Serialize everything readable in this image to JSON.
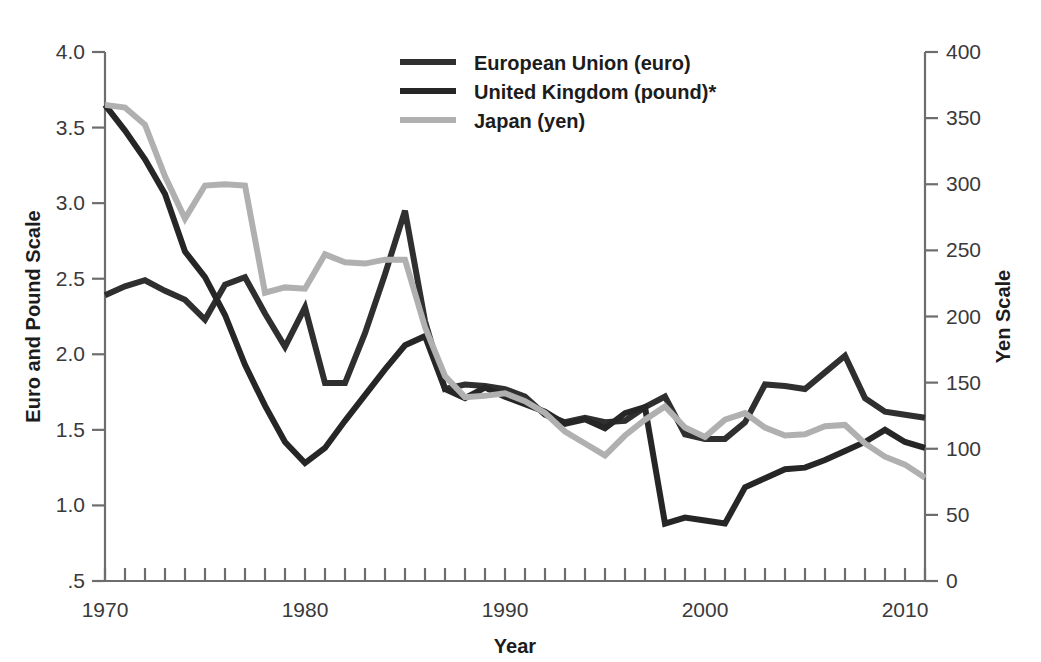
{
  "chart_data": {
    "type": "line",
    "title": "",
    "xlabel": "Year",
    "ylabel": "Euro and Pound Scale",
    "ylabel_right": "Yen Scale",
    "xlim": [
      1970,
      2011
    ],
    "ylim": [
      0.5,
      4.0
    ],
    "ylim_right": [
      0,
      400
    ],
    "grid": false,
    "legend_position": "top-center",
    "x_tick_labels": [
      "1970",
      "1980",
      "1990",
      "2000",
      "2010"
    ],
    "x_tick_values": [
      1970,
      1980,
      1990,
      2000,
      2010
    ],
    "x_minor_ticks_every": 1,
    "y_tick_labels": [
      ".5",
      "1.0",
      "1.5",
      "2.0",
      "2.5",
      "3.0",
      "3.5",
      "4.0"
    ],
    "y_tick_values": [
      0.5,
      1.0,
      1.5,
      2.0,
      2.5,
      3.0,
      3.5,
      4.0
    ],
    "y_right_tick_labels": [
      "0",
      "50",
      "100",
      "150",
      "200",
      "250",
      "300",
      "350",
      "400"
    ],
    "y_right_tick_values": [
      0,
      50,
      100,
      150,
      200,
      250,
      300,
      350,
      400
    ],
    "footnote_marker": "*",
    "x": [
      1970,
      1971,
      1972,
      1973,
      1974,
      1975,
      1976,
      1977,
      1978,
      1979,
      1980,
      1981,
      1982,
      1983,
      1984,
      1985,
      1986,
      1987,
      1988,
      1989,
      1990,
      1991,
      1992,
      1993,
      1994,
      1995,
      1996,
      1997,
      1998,
      1999,
      2000,
      2001,
      2002,
      2003,
      2004,
      2005,
      2006,
      2007,
      2008,
      2009,
      2010,
      2011
    ],
    "series": [
      {
        "name": "European Union (euro)",
        "axis": "left",
        "color": "#2f2f2f",
        "width": 6,
        "values": [
          2.39,
          2.45,
          2.49,
          2.42,
          2.36,
          2.23,
          2.46,
          2.51,
          2.27,
          2.05,
          2.31,
          1.81,
          1.81,
          2.14,
          2.53,
          2.95,
          2.22,
          1.77,
          1.8,
          1.79,
          1.77,
          1.72,
          1.6,
          1.55,
          1.58,
          1.55,
          1.56,
          1.65,
          1.72,
          1.47,
          1.44,
          1.44,
          1.55,
          1.8,
          1.79,
          1.77,
          1.88,
          1.99,
          1.71,
          1.62,
          1.6,
          1.58
        ]
      },
      {
        "name": "United Kingdom (pound)*",
        "axis": "left",
        "color": "#262626",
        "width": 6,
        "values": [
          3.65,
          3.48,
          3.29,
          3.06,
          2.68,
          2.51,
          2.26,
          1.93,
          1.66,
          1.42,
          1.28,
          1.38,
          1.56,
          1.73,
          1.9,
          2.06,
          2.12,
          1.77,
          1.71,
          1.78,
          1.72,
          1.67,
          1.62,
          1.54,
          1.57,
          1.51,
          1.61,
          1.65,
          0.88,
          0.92,
          0.9,
          0.88,
          1.12,
          1.18,
          1.24,
          1.25,
          1.3,
          1.36,
          1.42,
          1.5,
          1.42,
          1.38
        ]
      },
      {
        "name": "Japan (yen)",
        "axis": "right",
        "color": "#b0b0b0",
        "width": 6,
        "values": [
          360,
          358,
          345,
          306,
          274,
          299,
          300,
          299,
          218,
          222,
          221,
          247,
          241,
          240,
          243,
          243,
          192,
          155,
          139,
          140,
          142,
          136,
          127,
          113,
          104,
          95,
          110,
          122,
          132,
          116,
          109,
          122,
          127,
          116,
          110,
          111,
          117,
          118,
          104,
          94,
          88,
          78
        ]
      }
    ]
  },
  "legend": {
    "items": [
      {
        "label": "European Union (euro)",
        "swatch": "#2f2f2f"
      },
      {
        "label": "United Kingdom (pound)*",
        "swatch": "#262626"
      },
      {
        "label": "Japan (yen)",
        "swatch": "#b0b0b0"
      }
    ]
  },
  "axes": {
    "left_title": "Euro and Pound Scale",
    "right_title": "Yen Scale",
    "bottom_title": "Year"
  }
}
